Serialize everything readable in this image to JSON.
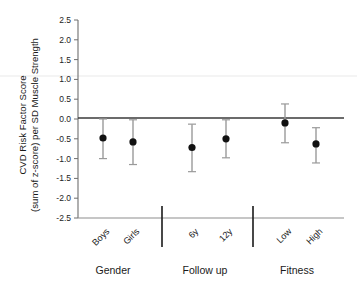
{
  "chart_data": {
    "type": "scatter",
    "title": "",
    "xlabel": "",
    "ylabel_line1": "CVD Risk Factor Score",
    "ylabel_line2": "(sum of z-score) per SD Muscle Strength",
    "ylim": [
      -2.5,
      2.5
    ],
    "ytick_values": [
      2.5,
      2.0,
      1.5,
      1.0,
      0.5,
      0.0,
      -0.5,
      -1.0,
      -1.5,
      -2.0,
      -2.5
    ],
    "ytick_labels": [
      "2.5",
      "2.0",
      "1.5",
      "1.0",
      "0.5",
      "0.0",
      "-0.5",
      "-1.0",
      "-1.5",
      "-2.0",
      "-2.5"
    ],
    "grid": false,
    "legend": "none",
    "reference_line": 0.0,
    "categories": [
      "Boys",
      "Girls",
      "6y",
      "12y",
      "Low",
      "High"
    ],
    "values": [
      -0.48,
      -0.58,
      -0.72,
      -0.5,
      -0.1,
      -0.63
    ],
    "ci_low": [
      -1.0,
      -1.15,
      -1.33,
      -0.98,
      -0.6,
      -1.11
    ],
    "ci_high": [
      0.0,
      -0.02,
      -0.13,
      -0.02,
      0.38,
      -0.22
    ],
    "groups": [
      {
        "label": "Gender",
        "categories": [
          "Boys",
          "Girls"
        ]
      },
      {
        "label": "Follow up",
        "categories": [
          "6y",
          "12y"
        ]
      },
      {
        "label": "Fitness",
        "categories": [
          "Low",
          "High"
        ]
      }
    ],
    "group_separators": 2,
    "marker_color": "#111111",
    "errorbar_color": "#9a9a9a",
    "axis_color": "#6e6e6e",
    "zero_line_color": "#3a3a3a"
  }
}
